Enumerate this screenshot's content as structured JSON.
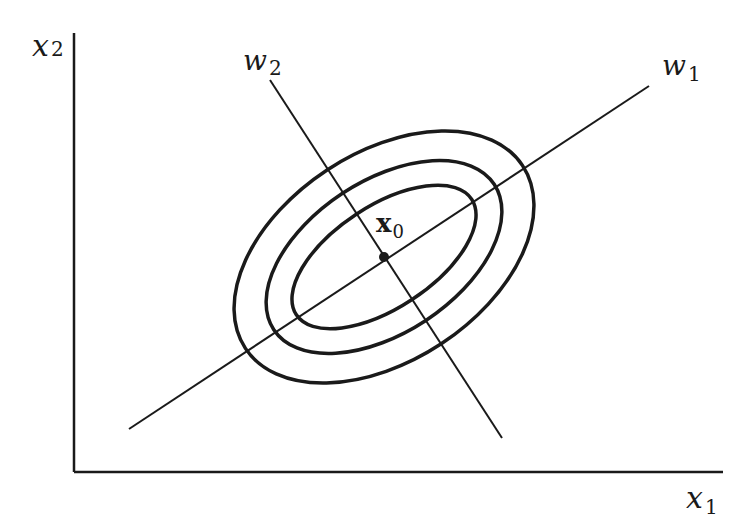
{
  "diagram": {
    "axes": {
      "x_label": "x",
      "x_sub": "1",
      "y_label": "x",
      "y_sub": "2"
    },
    "principal_axes": [
      {
        "label": "w",
        "sub": "1",
        "description": "major axis"
      },
      {
        "label": "w",
        "sub": "2",
        "description": "minor axis"
      }
    ],
    "center": {
      "label": "x",
      "sub": "0"
    },
    "contours": {
      "count": 3,
      "center_px": [
        384,
        257
      ],
      "rotation_deg": -33.4,
      "semi_axes_px": [
        [
          105,
          51
        ],
        [
          132,
          76
        ],
        [
          166,
          104
        ]
      ]
    },
    "colors": {
      "stroke": "#1a1a1a",
      "background": "#ffffff"
    }
  }
}
